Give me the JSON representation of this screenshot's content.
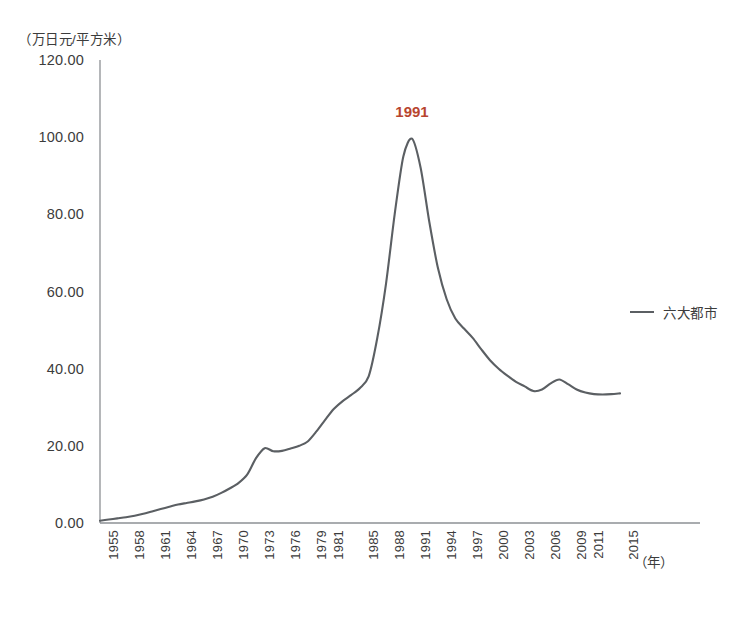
{
  "chart_data": {
    "type": "line",
    "title": "",
    "subtitle": "",
    "ylabel": "（万日元/平方米）",
    "xlabel": "（年）",
    "ylim": [
      0,
      120
    ],
    "y_ticks": [
      "0.00",
      "20.00",
      "40.00",
      "60.00",
      "80.00",
      "100.00",
      "120.00"
    ],
    "y_tick_values": [
      0,
      20,
      40,
      60,
      80,
      100,
      120
    ],
    "grid": false,
    "legend_position": "right",
    "annotations": [
      {
        "text": "1991",
        "x": 1991,
        "y": 99.6,
        "color": "#b8452f"
      }
    ],
    "tick_labels": [
      "1955",
      "1958",
      "1961",
      "1964",
      "1967",
      "1970",
      "1973",
      "1976",
      "1979",
      "1981",
      "1985",
      "1988",
      "1991",
      "1994",
      "1997",
      "2000",
      "2003",
      "2006",
      "2009",
      "2011",
      "2015"
    ],
    "series": [
      {
        "name": "六大都市",
        "color": "#5b5f63",
        "x": [
          1955,
          1956,
          1957,
          1958,
          1959,
          1960,
          1961,
          1962,
          1963,
          1964,
          1965,
          1966,
          1967,
          1968,
          1969,
          1970,
          1971,
          1972,
          1973,
          1974,
          1975,
          1976,
          1977,
          1978,
          1979,
          1980,
          1981,
          1982,
          1983,
          1984,
          1985,
          1986,
          1987,
          1988,
          1989,
          1990,
          1991,
          1992,
          1993,
          1994,
          1995,
          1996,
          1997,
          1998,
          1999,
          2000,
          2001,
          2002,
          2003,
          2004,
          2005,
          2006,
          2007,
          2008,
          2009,
          2010,
          2011,
          2012,
          2013,
          2014,
          2015
        ],
        "values": [
          0.6,
          0.9,
          1.2,
          1.5,
          1.9,
          2.4,
          3.0,
          3.6,
          4.2,
          4.8,
          5.2,
          5.6,
          6.1,
          6.8,
          7.8,
          9.0,
          10.4,
          12.6,
          16.8,
          19.4,
          18.6,
          18.7,
          19.3,
          20.0,
          21.2,
          23.8,
          26.8,
          29.6,
          31.6,
          33.2,
          35.0,
          38.0,
          48.0,
          62.0,
          80.0,
          95.0,
          99.6,
          92.0,
          78.0,
          66.0,
          58.0,
          53.0,
          50.4,
          48.0,
          45.0,
          42.2,
          40.0,
          38.2,
          36.6,
          35.4,
          34.2,
          34.6,
          36.2,
          37.2,
          36.0,
          34.6,
          33.8,
          33.4,
          33.3,
          33.4,
          33.6
        ]
      }
    ]
  },
  "legend": {
    "items": [
      {
        "label": "六大都市",
        "color": "#5b5f63"
      }
    ]
  },
  "axes": {
    "y_caption": "（万日元/平方米）",
    "x_caption": "（年）"
  }
}
